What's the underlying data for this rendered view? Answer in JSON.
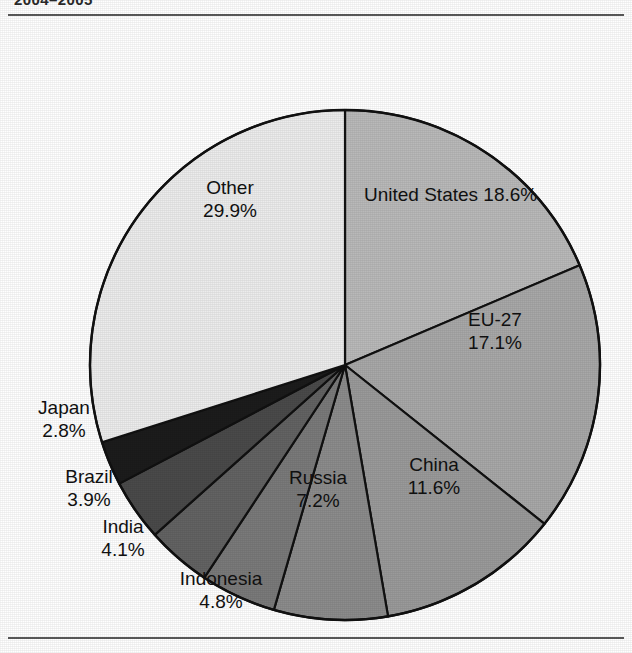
{
  "figure": {
    "caption_partial": "2004–2005",
    "has_top_rule": true,
    "has_bottom_rule": true
  },
  "chart_data": {
    "type": "pie",
    "title": "",
    "subtitle": "",
    "xlabel": "",
    "ylabel": "",
    "legend_position": "none",
    "grid": false,
    "units": "percent",
    "total": 100.0,
    "start_angle_deg": 0,
    "direction": "clockwise",
    "categories": [
      "United States",
      "EU-27",
      "China",
      "Russia",
      "Indonesia",
      "India",
      "Brazil",
      "Japan",
      "Other"
    ],
    "values": [
      18.6,
      17.1,
      11.6,
      7.2,
      4.8,
      4.1,
      3.9,
      2.8,
      29.9
    ],
    "slices": [
      {
        "label": "United States",
        "value": 18.6,
        "value_text": "18.6%",
        "label_text": "United States 18.6%",
        "label_line1": "United States 18.6%",
        "label_line2": "",
        "label_placement": "inside",
        "label_color": "#111111",
        "fill": "#b9b9b9"
      },
      {
        "label": "EU-27",
        "value": 17.1,
        "value_text": "17.1%",
        "label_text": "EU-27 17.1%",
        "label_line1": "EU-27",
        "label_line2": "17.1%",
        "label_placement": "inside",
        "label_color": "#111111",
        "fill": "#a8a8a8"
      },
      {
        "label": "China",
        "value": 11.6,
        "value_text": "11.6%",
        "label_text": "China 11.6%",
        "label_line1": "China",
        "label_line2": "11.6%",
        "label_placement": "inside",
        "label_color": "#111111",
        "fill": "#9a9a9a"
      },
      {
        "label": "Russia",
        "value": 7.2,
        "value_text": "7.2%",
        "label_text": "Russia 7.2%",
        "label_line1": "Russia",
        "label_line2": "7.2%",
        "label_placement": "inside",
        "label_color": "#111111",
        "fill": "#8c8c8c"
      },
      {
        "label": "Indonesia",
        "value": 4.8,
        "value_text": "4.8%",
        "label_text": "Indonesia 4.8%",
        "label_line1": "Indonesia",
        "label_line2": "4.8%",
        "label_placement": "outside",
        "label_color": "#111111",
        "fill": "#7a7a7a"
      },
      {
        "label": "India",
        "value": 4.1,
        "value_text": "4.1%",
        "label_text": "India 4.1%",
        "label_line1": "India",
        "label_line2": "4.1%",
        "label_placement": "outside",
        "label_color": "#111111",
        "fill": "#636363"
      },
      {
        "label": "Brazil",
        "value": 3.9,
        "value_text": "3.9%",
        "label_text": "Brazil 3.9%",
        "label_line1": "Brazil",
        "label_line2": "3.9%",
        "label_placement": "outside",
        "label_color": "#111111",
        "fill": "#4a4a4a"
      },
      {
        "label": "Japan",
        "value": 2.8,
        "value_text": "2.8%",
        "label_text": "Japan 2.8%",
        "label_line1": "Japan",
        "label_line2": "2.8%",
        "label_placement": "outside",
        "label_color": "#111111",
        "fill": "#1c1c1c"
      },
      {
        "label": "Other",
        "value": 29.9,
        "value_text": "29.9%",
        "label_text": "Other 29.9%",
        "label_line1": "Other",
        "label_line2": "29.9%",
        "label_placement": "inside",
        "label_color": "#111111",
        "fill": "#ececec"
      }
    ],
    "colors": {
      "outline": "#111111",
      "background": "#ffffff",
      "rule": "#5a5a5a"
    }
  }
}
